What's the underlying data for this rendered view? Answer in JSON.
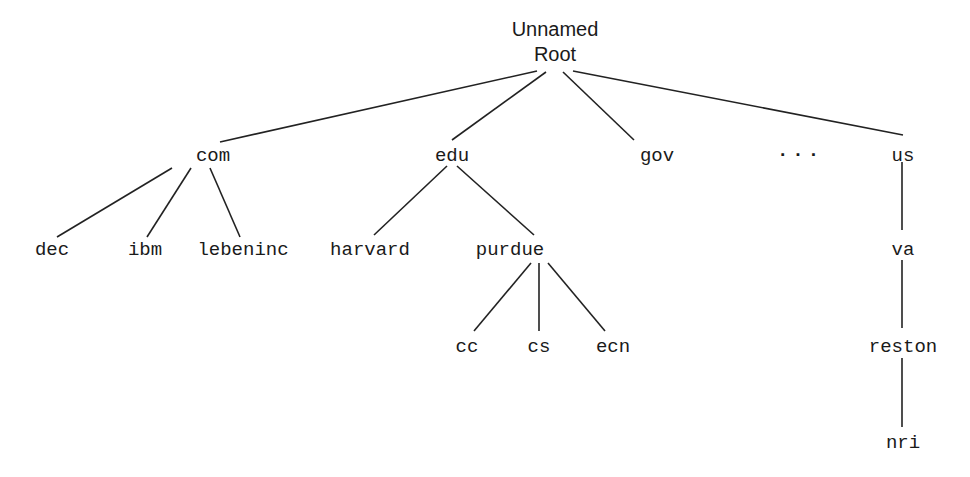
{
  "diagram": {
    "type": "tree",
    "root": {
      "line1": "Unnamed",
      "line2": "Root",
      "x": 555,
      "y": 42
    },
    "nodes": [
      {
        "id": "com",
        "label": "com",
        "x": 213,
        "y": 156
      },
      {
        "id": "edu",
        "label": "edu",
        "x": 452,
        "y": 156
      },
      {
        "id": "gov",
        "label": "gov",
        "x": 657,
        "y": 156
      },
      {
        "id": "ellipsis",
        "label": "...",
        "x": 800,
        "y": 151
      },
      {
        "id": "us",
        "label": "us",
        "x": 903,
        "y": 156
      },
      {
        "id": "dec",
        "label": "dec",
        "x": 52,
        "y": 250
      },
      {
        "id": "ibm",
        "label": "ibm",
        "x": 145,
        "y": 250
      },
      {
        "id": "lebeninc",
        "label": "lebeninc",
        "x": 243,
        "y": 250
      },
      {
        "id": "harvard",
        "label": "harvard",
        "x": 370,
        "y": 250
      },
      {
        "id": "purdue",
        "label": "purdue",
        "x": 510,
        "y": 250
      },
      {
        "id": "va",
        "label": "va",
        "x": 903,
        "y": 250
      },
      {
        "id": "cc",
        "label": "cc",
        "x": 467,
        "y": 347
      },
      {
        "id": "cs",
        "label": "cs",
        "x": 539,
        "y": 347
      },
      {
        "id": "ecn",
        "label": "ecn",
        "x": 613,
        "y": 347
      },
      {
        "id": "reston",
        "label": "reston",
        "x": 903,
        "y": 347
      },
      {
        "id": "nri",
        "label": "nri",
        "x": 903,
        "y": 443
      }
    ],
    "edges": [
      {
        "from": "root",
        "to": "com",
        "x1": 537,
        "y1": 71,
        "x2": 220,
        "y2": 142
      },
      {
        "from": "root",
        "to": "edu",
        "x1": 546,
        "y1": 72,
        "x2": 452,
        "y2": 140
      },
      {
        "from": "root",
        "to": "gov",
        "x1": 563,
        "y1": 72,
        "x2": 634,
        "y2": 140
      },
      {
        "from": "root",
        "to": "us",
        "x1": 573,
        "y1": 71,
        "x2": 903,
        "y2": 135
      },
      {
        "from": "com",
        "to": "dec",
        "x1": 172,
        "y1": 168,
        "x2": 57,
        "y2": 237
      },
      {
        "from": "com",
        "to": "ibm",
        "x1": 191,
        "y1": 168,
        "x2": 147,
        "y2": 237
      },
      {
        "from": "com",
        "to": "lebeninc",
        "x1": 210,
        "y1": 168,
        "x2": 240,
        "y2": 237
      },
      {
        "from": "edu",
        "to": "harvard",
        "x1": 447,
        "y1": 166,
        "x2": 374,
        "y2": 235
      },
      {
        "from": "edu",
        "to": "purdue",
        "x1": 457,
        "y1": 166,
        "x2": 534,
        "y2": 235
      },
      {
        "from": "purdue",
        "to": "cc",
        "x1": 531,
        "y1": 263,
        "x2": 474,
        "y2": 331
      },
      {
        "from": "purdue",
        "to": "cs",
        "x1": 539,
        "y1": 263,
        "x2": 539,
        "y2": 331
      },
      {
        "from": "purdue",
        "to": "ecn",
        "x1": 548,
        "y1": 263,
        "x2": 605,
        "y2": 331
      },
      {
        "from": "us",
        "to": "va",
        "x1": 902,
        "y1": 162,
        "x2": 902,
        "y2": 230
      },
      {
        "from": "va",
        "to": "reston",
        "x1": 902,
        "y1": 260,
        "x2": 902,
        "y2": 328
      },
      {
        "from": "reston",
        "to": "nri",
        "x1": 902,
        "y1": 358,
        "x2": 902,
        "y2": 427
      }
    ]
  },
  "colors": {
    "line": "#222222",
    "text": "#1a1a1a",
    "background": "#ffffff"
  }
}
